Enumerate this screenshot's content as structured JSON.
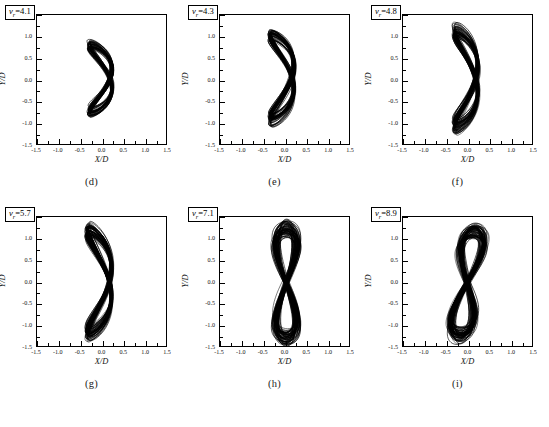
{
  "figure": {
    "caption": "",
    "panel_count": 6,
    "axis": {
      "xlabel": "X/D",
      "ylabel": "Y/D",
      "xticks": [
        "-1.5",
        "-1.0",
        "-0.5",
        "0.0",
        "0.5",
        "1.0",
        "1.5"
      ],
      "yticks": [
        "1.5",
        "1.0",
        "0.5",
        "0.0",
        "-0.5",
        "-1.0",
        "-1.5"
      ],
      "xlim": [
        -1.5,
        1.5
      ],
      "ylim": [
        -1.5,
        1.5
      ]
    }
  },
  "chart_data": {
    "type": "line",
    "title": "",
    "xlabel": "X/D",
    "ylabel": "Y/D",
    "xlim": [
      -1.5,
      1.5
    ],
    "ylim": [
      -1.5,
      1.5
    ],
    "grid": false,
    "legend": "none",
    "panels": [
      {
        "id": "d",
        "panel_label": "(d)",
        "annotation": "v_r=4.1",
        "vr_symbol": "v",
        "vr_subscript": "r",
        "vr_value": "4.1",
        "shape": "crescent",
        "x_extent": [
          -0.55,
          0.42
        ],
        "y_extent": [
          -0.82,
          0.85
        ],
        "trace_count": 40
      },
      {
        "id": "e",
        "panel_label": "(e)",
        "annotation": "v_r=4.3",
        "vr_symbol": "v",
        "vr_subscript": "r",
        "vr_value": "4.3",
        "shape": "crescent",
        "x_extent": [
          -0.62,
          0.4
        ],
        "y_extent": [
          -0.98,
          1.08
        ],
        "trace_count": 45
      },
      {
        "id": "f",
        "panel_label": "(f)",
        "annotation": "v_r=4.8",
        "vr_symbol": "v",
        "vr_subscript": "r",
        "vr_value": "4.8",
        "shape": "crescent",
        "x_extent": [
          -0.58,
          0.42
        ],
        "y_extent": [
          -1.18,
          1.22
        ],
        "trace_count": 50
      },
      {
        "id": "g",
        "panel_label": "(g)",
        "annotation": "v_r=5.7",
        "vr_symbol": "v",
        "vr_subscript": "r",
        "vr_value": "5.7",
        "shape": "crescent-broad",
        "x_extent": [
          -0.62,
          0.42
        ],
        "y_extent": [
          -1.3,
          1.3
        ],
        "trace_count": 55
      },
      {
        "id": "h",
        "panel_label": "(h)",
        "annotation": "v_r=7.1",
        "vr_symbol": "v",
        "vr_subscript": "r",
        "vr_value": "7.1",
        "shape": "vertical-band",
        "x_extent": [
          -0.52,
          0.6
        ],
        "y_extent": [
          -1.4,
          1.32
        ],
        "trace_count": 60
      },
      {
        "id": "i",
        "panel_label": "(i)",
        "annotation": "v_r=8.9",
        "vr_symbol": "v",
        "vr_subscript": "r",
        "vr_value": "8.9",
        "shape": "vertical-band-tilted",
        "x_extent": [
          -0.6,
          0.58
        ],
        "y_extent": [
          -1.32,
          1.25
        ],
        "trace_count": 60
      }
    ]
  }
}
